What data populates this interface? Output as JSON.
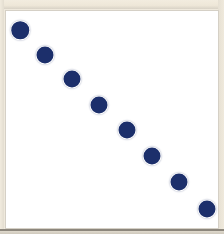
{
  "figure": {
    "background_color": "#efe9dc",
    "panel_color": "#ffffff",
    "panel_border_color": "#d5d0c6",
    "marker_color": "#1c2f6b"
  },
  "chart_data": {
    "type": "scatter",
    "title": "",
    "subtitle": "",
    "xlabel": "",
    "ylabel": "",
    "grid": false,
    "legend": null,
    "legend_position": "none",
    "xlim": [
      0,
      9
    ],
    "ylim": [
      0,
      9
    ],
    "xticks": [],
    "yticks": [],
    "xticklabels": [],
    "yticklabels": [],
    "marker": "circle",
    "marker_color": "#1c2f6b",
    "marker_size_px": 17,
    "series": [
      {
        "name": "series-1",
        "x": [
          1,
          2,
          3,
          4,
          5,
          6,
          7,
          8
        ],
        "y": [
          8,
          7,
          6,
          5,
          4,
          3,
          2,
          1
        ],
        "points": [
          {
            "label": "point-1",
            "x": 1,
            "y": 8,
            "px": 19.0,
            "py": 29.0,
            "d": 17.5
          },
          {
            "label": "point-2",
            "x": 2,
            "y": 7,
            "px": 44.0,
            "py": 54.0,
            "d": 17.0
          },
          {
            "label": "point-3",
            "x": 3,
            "y": 6,
            "px": 71.0,
            "py": 78.0,
            "d": 17.0
          },
          {
            "label": "point-4",
            "x": 4,
            "y": 5,
            "px": 97.5,
            "py": 103.5,
            "d": 17.0
          },
          {
            "label": "point-5",
            "x": 5,
            "y": 4,
            "px": 125.5,
            "py": 129.0,
            "d": 17.0
          },
          {
            "label": "point-6",
            "x": 6,
            "y": 3,
            "px": 151.0,
            "py": 155.0,
            "d": 17.0
          },
          {
            "label": "point-7",
            "x": 7,
            "y": 2,
            "px": 178.0,
            "py": 180.5,
            "d": 17.0
          },
          {
            "label": "point-8",
            "x": 8,
            "y": 1,
            "px": 205.5,
            "py": 207.5,
            "d": 17.0
          }
        ]
      }
    ],
    "annotations": []
  }
}
